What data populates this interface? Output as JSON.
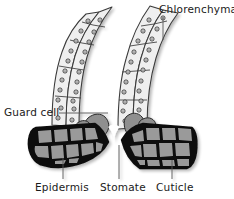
{
  "figure": {
    "labels": {
      "chlorenchyma": "Chlorenchyma",
      "guard_cell": "Guard cell",
      "epidermis": "Epidermis",
      "stomate": "Stomate",
      "cuticle": "Cuticle"
    },
    "colors": {
      "background": "#ffffff",
      "outline": "#1a1a1a",
      "chlorenchyma_fill": "#efefef",
      "chlorenchyma_stroke": "#3a3a3a",
      "chloroplast_fill": "#d8d8d8",
      "chloroplast_stroke": "#2b2b2b",
      "guard_cell_fill": "#8f8f8f",
      "guard_cell_stroke": "#2b2b2b",
      "epidermis_cell_fill": "#9a9a9a",
      "cuticle_stroke": "#0d0d0d",
      "leader_line": "#555555",
      "text": "#1a1a1a"
    },
    "structures": [
      {
        "name": "chlorenchyma",
        "description": "Two pairs of elongated palisade-like cell columns rising from the epidermis, pale fill with circular chloroplasts"
      },
      {
        "name": "guard-cell",
        "description": "Two mid-gray kidney-shaped cells flanking the central pore"
      },
      {
        "name": "stomate",
        "description": "Central pore opening between the two guard cells"
      },
      {
        "name": "epidermis",
        "description": "Blocks of polygonal gray cells on the left and right below the chlorenchyma"
      },
      {
        "name": "cuticle",
        "description": "Thick black outer boundary layer surrounding the epidermis blocks"
      }
    ]
  }
}
